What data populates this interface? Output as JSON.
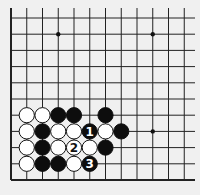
{
  "diagram": {
    "type": "go-board-fragment",
    "background": "#f0f0f0",
    "line_color": "#222222",
    "grid": {
      "columns": 12,
      "rows": 11,
      "origin_x": 11,
      "origin_y": 18,
      "spacing_x": 15.75,
      "spacing_y": 16.2,
      "left_edge": true,
      "bottom_edge": true,
      "line_extend_top": 8,
      "line_extend_right": 195
    },
    "star_points": [
      {
        "col": 3,
        "row": 1
      },
      {
        "col": 9,
        "row": 1
      },
      {
        "col": 9,
        "row": 7
      }
    ],
    "stones": [
      {
        "col": 1,
        "row": 6,
        "color": "white",
        "label": ""
      },
      {
        "col": 2,
        "row": 6,
        "color": "white",
        "label": ""
      },
      {
        "col": 3,
        "row": 6,
        "color": "black",
        "label": ""
      },
      {
        "col": 4,
        "row": 6,
        "color": "black",
        "label": ""
      },
      {
        "col": 6,
        "row": 6,
        "color": "black",
        "label": ""
      },
      {
        "col": 1,
        "row": 7,
        "color": "white",
        "label": ""
      },
      {
        "col": 2,
        "row": 7,
        "color": "black",
        "label": ""
      },
      {
        "col": 3,
        "row": 7,
        "color": "white",
        "label": ""
      },
      {
        "col": 4,
        "row": 7,
        "color": "white",
        "label": ""
      },
      {
        "col": 5,
        "row": 7,
        "color": "black",
        "label": "1"
      },
      {
        "col": 6,
        "row": 7,
        "color": "white",
        "label": ""
      },
      {
        "col": 7,
        "row": 7,
        "color": "black",
        "label": ""
      },
      {
        "col": 1,
        "row": 8,
        "color": "white",
        "label": ""
      },
      {
        "col": 2,
        "row": 8,
        "color": "black",
        "label": ""
      },
      {
        "col": 3,
        "row": 8,
        "color": "white",
        "label": ""
      },
      {
        "col": 4,
        "row": 8,
        "color": "white",
        "label": "2"
      },
      {
        "col": 5,
        "row": 8,
        "color": "white",
        "label": ""
      },
      {
        "col": 6,
        "row": 8,
        "color": "black",
        "label": ""
      },
      {
        "col": 1,
        "row": 9,
        "color": "white",
        "label": ""
      },
      {
        "col": 2,
        "row": 9,
        "color": "black",
        "label": ""
      },
      {
        "col": 3,
        "row": 9,
        "color": "black",
        "label": ""
      },
      {
        "col": 4,
        "row": 9,
        "color": "white",
        "label": ""
      },
      {
        "col": 5,
        "row": 9,
        "color": "black",
        "label": "3"
      }
    ]
  }
}
